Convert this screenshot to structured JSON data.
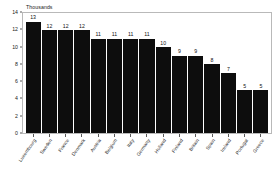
{
  "chart_data": {
    "type": "bar",
    "title": "",
    "axis_note": "Thousands",
    "xlabel": "",
    "ylabel": "Thousands",
    "ylim": [
      0,
      14
    ],
    "yticks": [
      0,
      2,
      4,
      6,
      8,
      10,
      12,
      14
    ],
    "grid": false,
    "legend": false,
    "bar_color": "#0d0d0d",
    "plot_border_color": "#b9b9b9",
    "background_color": "#ffffff",
    "categories": [
      "Luxembourg",
      "Sweden",
      "France",
      "Denmark",
      "Austria",
      "Belgium",
      "Italy",
      "Germany",
      "Holland",
      "Finland",
      "Britain",
      "Spain",
      "Ireland",
      "Portugal",
      "Greece"
    ],
    "values": [
      13,
      12,
      12,
      12,
      11,
      11,
      11,
      11,
      10,
      9,
      9,
      8,
      7,
      5,
      5
    ],
    "data_labels": [
      "13",
      "12",
      "12",
      "12",
      "11",
      "11",
      "11",
      "11",
      "10",
      "9",
      "9",
      "8",
      "7",
      "5",
      "5"
    ],
    "ytick_labels": [
      "0",
      "2",
      "4",
      "6",
      "8",
      "10",
      "12",
      "14"
    ]
  }
}
